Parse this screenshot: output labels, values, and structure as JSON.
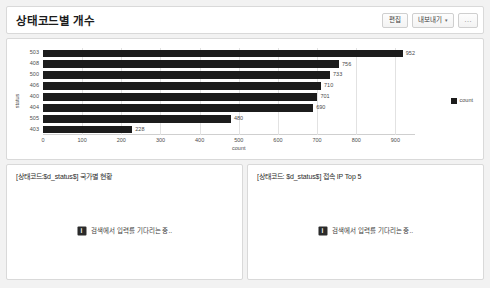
{
  "header": {
    "title": "상태코드별 개수",
    "actions": [
      {
        "name": "edit-button",
        "label": "편집",
        "caret": false
      },
      {
        "name": "export-button",
        "label": "내보내기",
        "caret": true,
        "caret_glyph": "▾"
      },
      {
        "name": "more-options-button",
        "label": "…",
        "caret": false
      }
    ]
  },
  "chart_data": {
    "type": "bar",
    "orientation": "horizontal",
    "title": "",
    "categories": [
      "503",
      "408",
      "500",
      "406",
      "400",
      "404",
      "505",
      "403"
    ],
    "values": [
      952,
      756,
      733,
      710,
      701,
      690,
      480,
      228
    ],
    "series": [
      {
        "name": "count",
        "values": [
          952,
          756,
          733,
          710,
          701,
          690,
          480,
          228
        ]
      }
    ],
    "xlabel": "count",
    "ylabel": "status",
    "xlim": [
      0,
      950
    ],
    "xticks": [
      0,
      100,
      200,
      300,
      400,
      500,
      600,
      700,
      800,
      900
    ],
    "grid": true,
    "legend": {
      "position": "right",
      "entries": [
        "count"
      ]
    },
    "bar_color": "#1c1c1c",
    "data_labels": true
  },
  "bottom_panels": [
    {
      "name": "country-status-panel",
      "title": "[상태코드:$d_status$] 국가별 현황",
      "waiting_icon": "i",
      "waiting_text": "검색에서 입력를 기다리는 중.."
    },
    {
      "name": "top-ip-panel",
      "title": "[상태코드: $d_status$] 접속 IP Top 5",
      "waiting_icon": "i",
      "waiting_text": "검색에서 입력를 기다리는 중.."
    }
  ]
}
